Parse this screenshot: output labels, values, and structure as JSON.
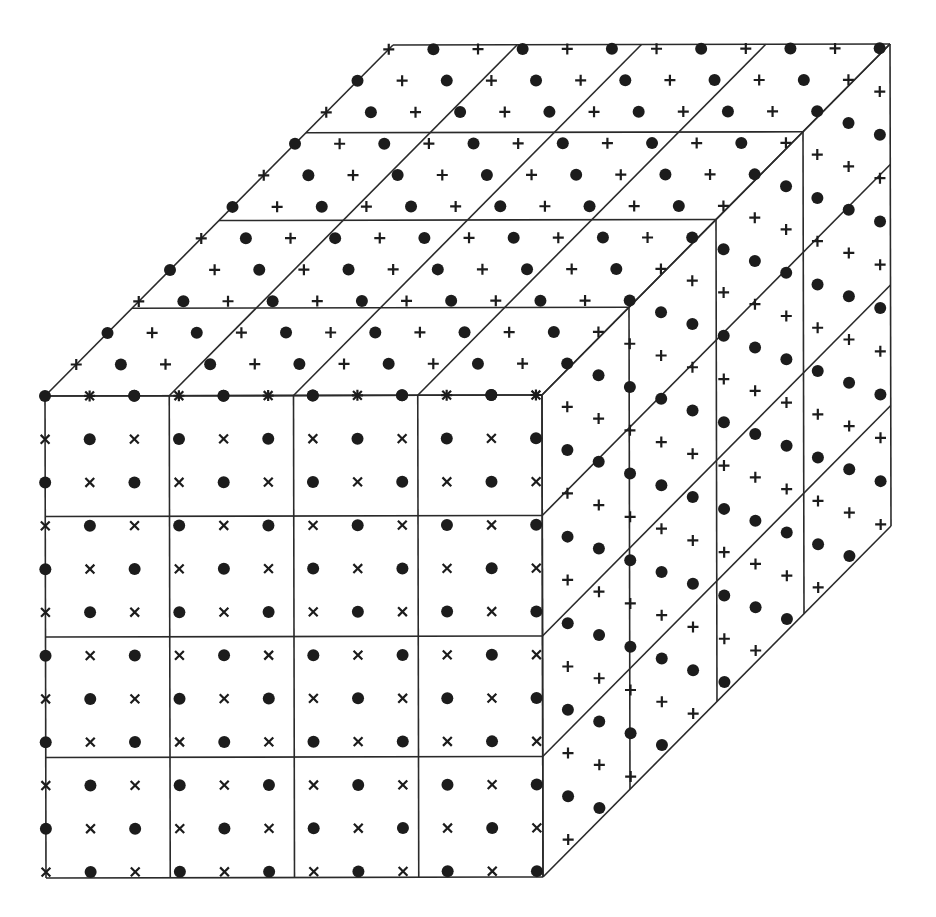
{
  "diagram": {
    "title": "Cubic lattice divided into 4x4x4 cells with alternating dot and cross sites",
    "colors": {
      "line": "#2a2a2a",
      "mark": "#1c1c1c",
      "background": "#ffffff"
    },
    "cube": {
      "front_top_left": [
        45,
        396
      ],
      "edge_x": [
        497,
        -1
      ],
      "edge_y": [
        1,
        482
      ],
      "edge_depth": [
        348,
        -351
      ],
      "cell_divisions": 4
    },
    "lattice": {
      "points_per_edge": 12,
      "spacing_fraction": 0.0898,
      "even_symbol": "dot",
      "faces": [
        {
          "name": "front",
          "odd_symbol": "x-cross"
        },
        {
          "name": "top",
          "odd_symbol": "plus"
        },
        {
          "name": "right",
          "odd_symbol": "plus"
        }
      ]
    },
    "legend": {
      "dot": "filled-circle",
      "x-cross": "diagonal-cross",
      "plus": "upright-cross"
    }
  }
}
